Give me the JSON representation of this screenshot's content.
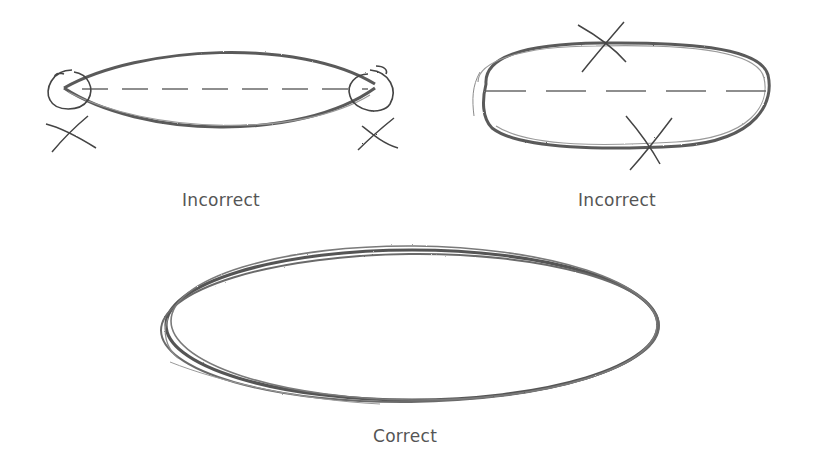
{
  "diagram": {
    "title": "",
    "examples": [
      {
        "id": "pointed-ends",
        "label": "Incorrect",
        "description": "Ellipse drawn with pointed ends (circled and crossed out)",
        "marks": [
          "circle-left-end",
          "circle-right-end",
          "x-left",
          "x-right"
        ]
      },
      {
        "id": "flattened-sides",
        "label": "Incorrect",
        "description": "Ellipse drawn with flat top/bottom sides (crossed out)",
        "marks": [
          "x-top",
          "x-bottom"
        ]
      },
      {
        "id": "smooth-ellipse",
        "label": "Correct",
        "description": "Smooth, continuous ellipse drawn with several passes",
        "marks": []
      }
    ],
    "colors": {
      "stroke": "#555555",
      "stroke_light": "#8a8a8a",
      "label": "#555555",
      "background": "#ffffff"
    }
  }
}
